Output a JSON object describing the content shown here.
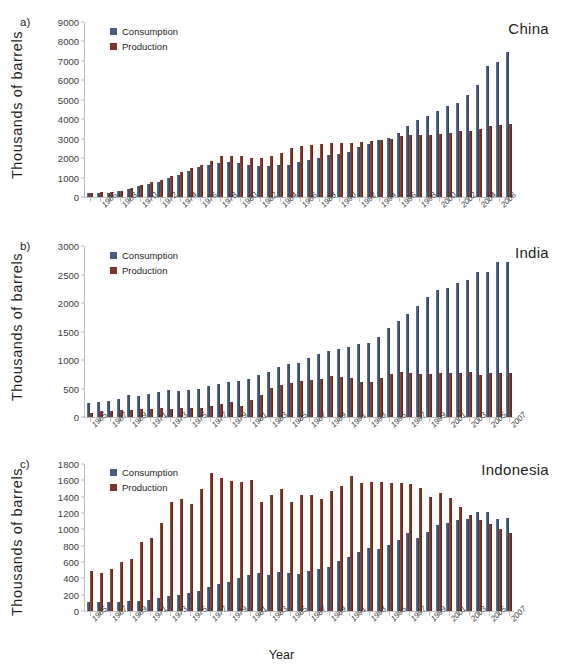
{
  "figure": {
    "ylabel": "Thousands of  barrels",
    "xlabel": "Year",
    "legend": {
      "consumption": "Consumption",
      "production": "Production"
    },
    "colors": {
      "consumption": "#4a5f80",
      "production": "#7b3528"
    }
  },
  "panels": [
    {
      "letter": "a)",
      "country": "China"
    },
    {
      "letter": "b)",
      "country": "India"
    },
    {
      "letter": "c)",
      "country": "Indonesia"
    }
  ],
  "chart_data": [
    {
      "type": "bar",
      "title": "China",
      "panel": "a)",
      "xlabel": "",
      "ylabel": "Thousands of  barrels",
      "ylim": [
        0,
        9000
      ],
      "yticks": [
        0,
        1000,
        2000,
        3000,
        4000,
        5000,
        6000,
        7000,
        8000,
        9000
      ],
      "grid": false,
      "legend_position": "top-left",
      "x": [
        1965,
        1966,
        1967,
        1968,
        1969,
        1970,
        1971,
        1972,
        1973,
        1974,
        1975,
        1976,
        1977,
        1978,
        1979,
        1980,
        1981,
        1982,
        1983,
        1984,
        1985,
        1986,
        1987,
        1988,
        1989,
        1990,
        1991,
        1992,
        1993,
        1994,
        1995,
        1996,
        1997,
        1998,
        1999,
        2000,
        2001,
        2002,
        2003,
        2004,
        2005,
        2006,
        2007
      ],
      "tick_labels": [
        "1966",
        "1968",
        "1970",
        "1972",
        "1974",
        "1976",
        "1978",
        "1980",
        "1982",
        "1984",
        "1986",
        "1988",
        "1990",
        "1992",
        "1994",
        "1996",
        "1998",
        "2000",
        "2002",
        "2004",
        "2006"
      ],
      "series": [
        {
          "name": "Consumption",
          "values": [
            215,
            225,
            225,
            300,
            420,
            560,
            690,
            790,
            980,
            1120,
            1340,
            1530,
            1640,
            1770,
            1810,
            1770,
            1670,
            1620,
            1590,
            1650,
            1670,
            1780,
            1900,
            2030,
            2180,
            2230,
            2290,
            2570,
            2730,
            2910,
            3060,
            3310,
            3660,
            3950,
            4190,
            4440,
            4680,
            4850,
            5230,
            5770,
            6720,
            6950,
            7450
          ],
          "color": "#4a5f80"
        },
        {
          "name": "Production",
          "values": [
            230,
            235,
            250,
            330,
            450,
            620,
            790,
            870,
            1090,
            1280,
            1480,
            1670,
            1850,
            2090,
            2120,
            2120,
            2020,
            2030,
            2120,
            2260,
            2500,
            2620,
            2690,
            2730,
            2760,
            2780,
            2800,
            2840,
            2890,
            2940,
            2990,
            3130,
            3200,
            3200,
            3210,
            3250,
            3300,
            3390,
            3410,
            3490,
            3630,
            3680,
            3730
          ],
          "color": "#7b3528"
        }
      ]
    },
    {
      "type": "bar",
      "title": "India",
      "panel": "b)",
      "xlabel": "",
      "ylabel": "Thousands of  barrels",
      "ylim": [
        0,
        3000
      ],
      "yticks": [
        0,
        500,
        1000,
        1500,
        2000,
        2500,
        3000
      ],
      "grid": false,
      "legend_position": "top-left",
      "x": [
        1965,
        1966,
        1967,
        1968,
        1969,
        1970,
        1971,
        1972,
        1973,
        1974,
        1975,
        1976,
        1977,
        1978,
        1979,
        1980,
        1981,
        1982,
        1983,
        1984,
        1985,
        1986,
        1987,
        1988,
        1989,
        1990,
        1991,
        1992,
        1993,
        1994,
        1995,
        1996,
        1997,
        1998,
        1999,
        2000,
        2001,
        2002,
        2003,
        2004,
        2005,
        2006,
        2007
      ],
      "tick_labels": [
        "1965",
        "1967",
        "1969",
        "1971",
        "1973",
        "1975",
        "1977",
        "1979",
        "1981",
        "1983",
        "1985",
        "1987",
        "1989",
        "1991",
        "1993",
        "1995",
        "1997",
        "1999",
        "2001",
        "2003",
        "2005",
        "2007"
      ],
      "series": [
        {
          "name": "Consumption",
          "values": [
            240,
            260,
            280,
            320,
            390,
            370,
            400,
            440,
            470,
            450,
            470,
            500,
            545,
            575,
            620,
            640,
            670,
            740,
            790,
            880,
            925,
            955,
            1040,
            1100,
            1155,
            1195,
            1225,
            1280,
            1300,
            1400,
            1555,
            1685,
            1800,
            1940,
            2105,
            2230,
            2265,
            2345,
            2405,
            2540,
            2545,
            2720,
            2720
          ],
          "color": "#4a5f80"
        },
        {
          "name": "Production",
          "values": [
            70,
            100,
            110,
            115,
            125,
            135,
            145,
            150,
            145,
            150,
            160,
            165,
            200,
            225,
            265,
            190,
            300,
            395,
            510,
            555,
            605,
            640,
            645,
            660,
            715,
            710,
            680,
            615,
            610,
            685,
            760,
            785,
            775,
            760,
            755,
            775,
            770,
            780,
            795,
            745,
            765,
            770,
            770
          ],
          "color": "#7b3528"
        }
      ]
    },
    {
      "type": "bar",
      "title": "Indonesia",
      "panel": "c)",
      "xlabel": "Year",
      "ylabel": "Thousands of  barrels",
      "ylim": [
        0,
        1800
      ],
      "yticks": [
        0,
        200,
        400,
        600,
        800,
        1000,
        1200,
        1400,
        1600,
        1800
      ],
      "grid": false,
      "legend_position": "top-left",
      "x": [
        1965,
        1966,
        1967,
        1968,
        1969,
        1970,
        1971,
        1972,
        1973,
        1974,
        1975,
        1976,
        1977,
        1978,
        1979,
        1980,
        1981,
        1982,
        1983,
        1984,
        1985,
        1986,
        1987,
        1988,
        1989,
        1990,
        1991,
        1992,
        1993,
        1994,
        1995,
        1996,
        1997,
        1998,
        1999,
        2000,
        2001,
        2002,
        2003,
        2004,
        2005,
        2006,
        2007
      ],
      "tick_labels": [
        "1965",
        "1967",
        "1969",
        "1971",
        "1973",
        "1975",
        "1977",
        "1979",
        "1981",
        "1983",
        "1985",
        "1987",
        "1989",
        "1991",
        "1993",
        "1995",
        "1997",
        "1999",
        "2001",
        "2003",
        "2005",
        "2007"
      ],
      "series": [
        {
          "name": "Consumption",
          "values": [
            115,
            110,
            105,
            115,
            125,
            125,
            140,
            155,
            180,
            200,
            225,
            240,
            290,
            330,
            360,
            405,
            440,
            460,
            440,
            475,
            460,
            455,
            485,
            510,
            535,
            610,
            660,
            720,
            775,
            760,
            805,
            870,
            950,
            900,
            970,
            1050,
            1075,
            1120,
            1130,
            1210,
            1215,
            1125,
            1140
          ],
          "color": "#4a5f80"
        },
        {
          "name": "Production",
          "values": [
            490,
            470,
            510,
            600,
            640,
            850,
            890,
            1080,
            1340,
            1375,
            1305,
            1500,
            1685,
            1630,
            1595,
            1580,
            1600,
            1330,
            1420,
            1500,
            1340,
            1425,
            1420,
            1370,
            1470,
            1535,
            1655,
            1570,
            1580,
            1575,
            1565,
            1570,
            1550,
            1510,
            1400,
            1440,
            1385,
            1275,
            1170,
            1110,
            1065,
            1000,
            950
          ],
          "color": "#7b3528"
        }
      ]
    }
  ]
}
